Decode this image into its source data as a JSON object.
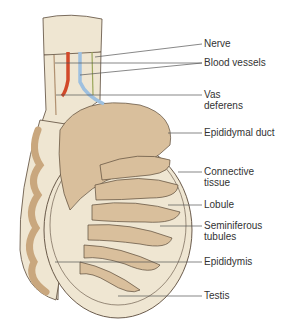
{
  "diagram": {
    "colors": {
      "tissue": "#efe6d2",
      "tubule": "#d9bf9c",
      "outline": "#5a4a3a",
      "artery": "#d2492a",
      "vein": "#9ec0df",
      "nerve": "#9aa65a",
      "leader": "#555555"
    },
    "labels": [
      {
        "id": "nerve",
        "lines": [
          "Nerve"
        ]
      },
      {
        "id": "blood-vessels",
        "lines": [
          "Blood vessels"
        ]
      },
      {
        "id": "vas-deferens",
        "lines": [
          "Vas",
          "deferens"
        ]
      },
      {
        "id": "epididymal-duct",
        "lines": [
          "Epididymal duct"
        ]
      },
      {
        "id": "connective-tissue",
        "lines": [
          "Connective",
          "tissue"
        ]
      },
      {
        "id": "lobule",
        "lines": [
          "Lobule"
        ]
      },
      {
        "id": "seminiferous-tubules",
        "lines": [
          "Seminiferous",
          "tubules"
        ]
      },
      {
        "id": "epididymis",
        "lines": [
          "Epididymis"
        ]
      },
      {
        "id": "testis",
        "lines": [
          "Testis"
        ]
      }
    ]
  }
}
